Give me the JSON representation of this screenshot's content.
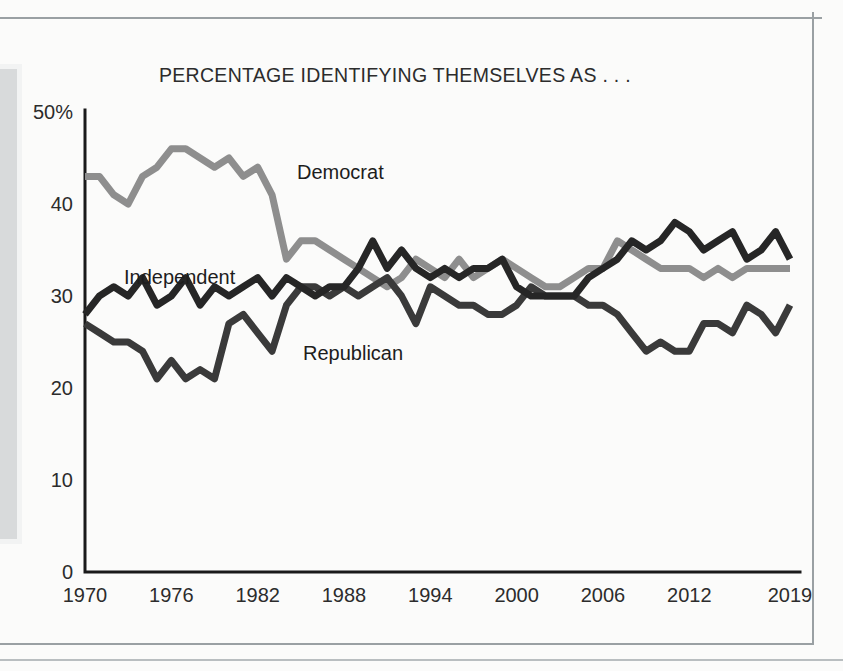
{
  "figure": {
    "title": "PERCENTAGE IDENTIFYING THEMSELVES AS . . ."
  },
  "labels": {
    "democrat": "Democrat",
    "independent": "Independent",
    "republican": "Republican"
  },
  "chart_data": {
    "type": "line",
    "title": "PERCENTAGE IDENTIFYING THEMSELVES AS . . .",
    "xlabel": "",
    "ylabel": "",
    "xlim": [
      1970,
      2019
    ],
    "ylim": [
      0,
      50
    ],
    "grid": false,
    "legend": "inline-annotations",
    "ytick_labels": [
      "0",
      "10",
      "20",
      "30",
      "40",
      "50%"
    ],
    "ytick_values": [
      0,
      10,
      20,
      30,
      40,
      50
    ],
    "xtick_labels": [
      "1970",
      "1976",
      "1982",
      "1988",
      "1994",
      "2000",
      "2006",
      "2012",
      "2019"
    ],
    "xtick_values": [
      1970,
      1976,
      1982,
      1988,
      1994,
      2000,
      2006,
      2012,
      2019
    ],
    "x": [
      1970,
      1971,
      1972,
      1973,
      1974,
      1975,
      1976,
      1977,
      1978,
      1979,
      1980,
      1981,
      1982,
      1983,
      1984,
      1985,
      1986,
      1987,
      1988,
      1989,
      1990,
      1991,
      1992,
      1993,
      1994,
      1995,
      1996,
      1997,
      1998,
      1999,
      2000,
      2001,
      2002,
      2003,
      2004,
      2005,
      2006,
      2007,
      2008,
      2009,
      2010,
      2011,
      2012,
      2013,
      2014,
      2015,
      2016,
      2017,
      2018,
      2019
    ],
    "series": [
      {
        "name": "Democrat",
        "color": "#8e8e8e",
        "values": [
          43,
          43,
          41,
          40,
          43,
          44,
          46,
          46,
          45,
          44,
          45,
          43,
          44,
          41,
          34,
          36,
          36,
          35,
          34,
          33,
          32,
          31,
          32,
          34,
          33,
          32,
          34,
          32,
          33,
          34,
          33,
          32,
          31,
          31,
          32,
          33,
          33,
          36,
          35,
          34,
          33,
          33,
          33,
          32,
          33,
          32,
          33,
          33,
          33,
          33
        ]
      },
      {
        "name": "Independent",
        "color": "#262626",
        "values": [
          28,
          30,
          31,
          30,
          32,
          29,
          30,
          32,
          29,
          31,
          30,
          31,
          32,
          30,
          32,
          31,
          30,
          31,
          31,
          33,
          36,
          33,
          35,
          33,
          32,
          33,
          32,
          33,
          33,
          34,
          31,
          30,
          30,
          30,
          30,
          32,
          33,
          34,
          36,
          35,
          36,
          38,
          37,
          35,
          36,
          37,
          34,
          35,
          37,
          34
        ]
      },
      {
        "name": "Republican",
        "color": "#3a3a3a",
        "values": [
          27,
          26,
          25,
          25,
          24,
          21,
          23,
          21,
          22,
          21,
          27,
          28,
          26,
          24,
          29,
          31,
          31,
          30,
          31,
          30,
          31,
          32,
          30,
          27,
          31,
          30,
          29,
          29,
          28,
          28,
          29,
          31,
          30,
          30,
          30,
          29,
          29,
          28,
          26,
          24,
          25,
          24,
          24,
          27,
          27,
          26,
          29,
          28,
          26,
          29
        ]
      }
    ]
  }
}
